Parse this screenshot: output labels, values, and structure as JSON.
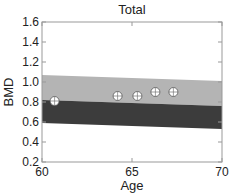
{
  "chart_data": {
    "type": "scatter",
    "title": "Total",
    "xlabel": "Age",
    "ylabel": "BMD",
    "xlim": [
      60,
      70
    ],
    "ylim": [
      0.2,
      1.6
    ],
    "xticks": [
      60,
      65,
      70
    ],
    "yticks": [
      0.2,
      0.4,
      0.6,
      0.8,
      1.0,
      1.2,
      1.4,
      1.6
    ],
    "xtick_labels": [
      "60",
      "65",
      "70"
    ],
    "ytick_labels": [
      "0.2",
      "0.4",
      "0.6",
      "0.8",
      "1.0",
      "1.2",
      "1.4",
      "1.6"
    ],
    "grid": false,
    "bands": [
      {
        "name": "upper reference band",
        "color": "#b4b4b4",
        "x": [
          60,
          70
        ],
        "top": [
          1.07,
          1.01
        ],
        "bottom": [
          0.82,
          0.76
        ]
      },
      {
        "name": "lower reference band",
        "color": "#3c3c3c",
        "x": [
          60,
          70
        ],
        "top": [
          0.82,
          0.76
        ],
        "bottom": [
          0.59,
          0.53
        ]
      }
    ],
    "series": [
      {
        "name": "patient measurements",
        "marker": "circle-plus",
        "x": [
          60.7,
          64.2,
          65.3,
          66.3,
          67.3
        ],
        "y": [
          0.81,
          0.86,
          0.86,
          0.9,
          0.9
        ]
      }
    ]
  }
}
